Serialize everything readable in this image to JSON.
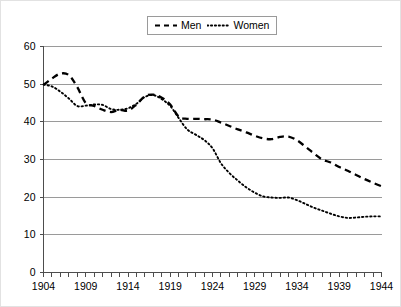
{
  "chart_data": {
    "type": "line",
    "title": "",
    "subtitle": "",
    "xlabel": "",
    "ylabel": "",
    "xlim": [
      1904,
      1944
    ],
    "ylim": [
      0,
      60
    ],
    "yticks": [
      0,
      10,
      20,
      30,
      40,
      50,
      60
    ],
    "ytick_labels": [
      "0",
      "10",
      "20",
      "30",
      "40",
      "50",
      "60"
    ],
    "xticks": [
      1904,
      1909,
      1914,
      1919,
      1924,
      1929,
      1934,
      1939,
      1944
    ],
    "xtick_labels": [
      "1904",
      "1909",
      "1914",
      "1919",
      "1924",
      "1929",
      "1934",
      "1939",
      "1944"
    ],
    "x_minor_tick_step": 1,
    "grid": "horizontal",
    "legend_position": "top-center",
    "x": [
      1904,
      1905,
      1906,
      1907,
      1908,
      1909,
      1910,
      1911,
      1912,
      1913,
      1914,
      1915,
      1916,
      1917,
      1918,
      1919,
      1920,
      1921,
      1922,
      1923,
      1924,
      1925,
      1926,
      1927,
      1928,
      1929,
      1930,
      1931,
      1932,
      1933,
      1934,
      1935,
      1936,
      1937,
      1938,
      1939,
      1940,
      1941,
      1942,
      1943,
      1944
    ],
    "series": [
      {
        "name": "Men",
        "style": "dashed",
        "color": "#000000",
        "values": [
          49.8,
          51.5,
          52.8,
          52.4,
          49.2,
          45.0,
          44.2,
          43.2,
          42.6,
          43.2,
          43.0,
          44.6,
          46.8,
          47.2,
          46.4,
          44.6,
          41.4,
          40.8,
          40.8,
          40.7,
          40.6,
          39.8,
          38.9,
          38.0,
          37.2,
          36.3,
          35.6,
          35.4,
          36.0,
          36.1,
          35.1,
          33.4,
          31.6,
          30.0,
          29.2,
          28.0,
          27.0,
          25.9,
          24.8,
          23.8,
          22.9
        ],
        "end_value": 22.9,
        "start_value": 49.8
      },
      {
        "name": "Women",
        "style": "dotted",
        "color": "#000000",
        "values": [
          49.9,
          49.4,
          48.0,
          46.2,
          44.2,
          44.3,
          44.6,
          44.5,
          43.4,
          43.2,
          43.6,
          44.8,
          46.6,
          47.1,
          46.0,
          44.2,
          41.0,
          38.0,
          36.6,
          35.2,
          33.0,
          29.0,
          26.4,
          24.4,
          22.6,
          21.2,
          20.2,
          19.9,
          19.8,
          19.9,
          19.2,
          18.2,
          17.2,
          16.4,
          15.6,
          14.9,
          14.5,
          14.6,
          14.8,
          14.9,
          14.9
        ],
        "end_value": 14.9,
        "start_value": 49.9
      }
    ],
    "annotations": []
  },
  "legend": {
    "entries": [
      {
        "label": "Men",
        "swatch": "dashed-line-swatch"
      },
      {
        "label": "Women",
        "swatch": "dotted-line-swatch"
      }
    ]
  },
  "axes": {
    "y_tick_labels": [
      "60",
      "50",
      "40",
      "30",
      "20",
      "10",
      "0"
    ],
    "x_tick_labels": [
      "1904",
      "1909",
      "1914",
      "1919",
      "1924",
      "1929",
      "1934",
      "1939",
      "1944"
    ]
  },
  "colors": {
    "line": "#000000",
    "grid": "#9a9a9a",
    "axis": "#4d4d4d",
    "background": "#ffffff",
    "frame": "#e2e2e2"
  }
}
